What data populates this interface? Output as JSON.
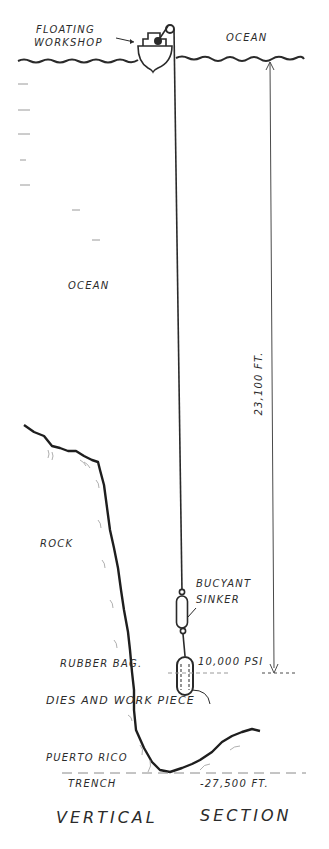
{
  "diagram": {
    "title_left": "Vertical",
    "title_right": "Section",
    "labels": {
      "floating_workshop_line1": "Floating",
      "floating_workshop_line2": "Workshop",
      "ocean_surface": "Ocean",
      "ocean_mid": "Ocean",
      "depth_dimension": "23,100 Ft.",
      "rock": "Rock",
      "buoyant_sinker_line1": "Bucyant",
      "buoyant_sinker_line2": "Sinker",
      "rubber_bag": "Rubber Bag.",
      "pressure": "10,000 PSI",
      "dies_and_work_piece": "Dies And Work Piece",
      "puerto_rico": "Puerto Rico",
      "trench": "Trench",
      "trench_depth": "-27,500 Ft."
    },
    "colors": {
      "ink": "#2a2a2a",
      "paper": "#ffffff",
      "faint": "#9a9a9a"
    }
  }
}
